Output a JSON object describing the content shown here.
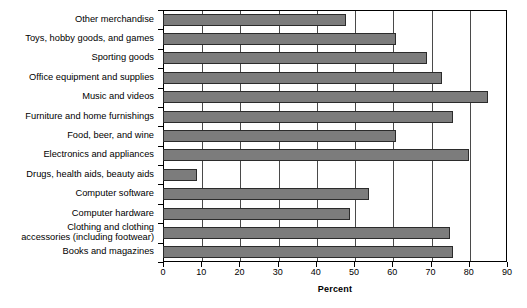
{
  "chart_data": {
    "type": "bar",
    "orientation": "horizontal",
    "title": "",
    "xlabel": "Percent",
    "ylabel": "",
    "xlim": [
      0,
      90
    ],
    "xticks": [
      0,
      10,
      20,
      30,
      40,
      50,
      60,
      70,
      80,
      90
    ],
    "xticklabels": [
      "0",
      "10",
      "20",
      "30",
      "40",
      "50",
      "60",
      "70",
      "80",
      "90"
    ],
    "grid": "vertical",
    "legend": "none",
    "bar_color": "#7c7c7c",
    "bar_edge_color": "#2b2b2b",
    "categories": [
      "Other merchandise",
      "Toys, hobby goods, and games",
      "Sporting goods",
      "Office equipment and supplies",
      "Music and videos",
      "Furniture and home furnishings",
      "Food, beer, and wine",
      "Electronics and appliances",
      "Drugs, health aids, beauty aids",
      "Computer software",
      "Computer hardware",
      "Clothing and clothing accessories (including footwear)",
      "Books and magazines"
    ],
    "category_lines": [
      [
        "Other merchandise"
      ],
      [
        "Toys, hobby goods, and games"
      ],
      [
        "Sporting goods"
      ],
      [
        "Office equipment and supplies"
      ],
      [
        "Music and videos"
      ],
      [
        "Furniture and home furnishings"
      ],
      [
        "Food, beer, and wine"
      ],
      [
        "Electronics and appliances"
      ],
      [
        "Drugs, health aids, beauty aids"
      ],
      [
        "Computer software"
      ],
      [
        "Computer hardware"
      ],
      [
        "Clothing and clothing",
        "accessories (including footwear)"
      ],
      [
        "Books and magazines"
      ]
    ],
    "values": [
      48,
      61,
      69,
      73,
      85,
      76,
      61,
      80,
      9,
      54,
      49,
      75,
      76
    ]
  }
}
